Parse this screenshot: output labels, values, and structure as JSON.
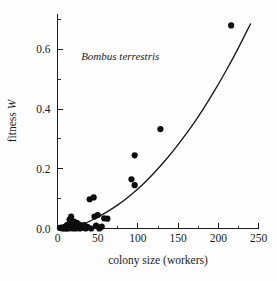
{
  "figure": {
    "annotation": "Bombus terrestris",
    "caption_fragment": ""
  },
  "chart_data": {
    "type": "scatter",
    "title": "",
    "subtitle": "",
    "annotations": [
      {
        "text": "Bombus terrestris",
        "x": 78,
        "y": 0.565,
        "style": "italic"
      }
    ],
    "xlabel": "colony size (workers)",
    "ylabel": "fitness W",
    "xlim": [
      0,
      250
    ],
    "ylim": [
      0,
      0.72
    ],
    "xticks": [
      0,
      50,
      100,
      150,
      200,
      250
    ],
    "xtick_labels": [
      "0",
      "50",
      "100",
      "150",
      "200",
      "250"
    ],
    "xticks_minor": [
      25,
      75,
      125,
      175,
      225
    ],
    "yticks": [
      0.0,
      0.2,
      0.4,
      0.6
    ],
    "ytick_labels": [
      "0.0",
      "0.2",
      "0.4",
      "0.6"
    ],
    "yticks_minor": [
      0.1,
      0.3,
      0.5,
      0.7
    ],
    "grid": false,
    "legend": null,
    "marker": "filled-circle",
    "marker_color": "#0d0d0d",
    "curve_color": "#181818",
    "series": [
      {
        "name": "colonies",
        "points": [
          [
            3,
            0.002
          ],
          [
            5,
            0.003
          ],
          [
            6,
            0.0
          ],
          [
            8,
            0.004
          ],
          [
            9,
            0.0
          ],
          [
            10,
            0.006
          ],
          [
            11,
            0.0
          ],
          [
            12,
            0.012
          ],
          [
            13,
            0.003
          ],
          [
            14,
            0.0
          ],
          [
            15,
            0.03
          ],
          [
            16,
            0.008
          ],
          [
            17,
            0.04
          ],
          [
            18,
            0.016
          ],
          [
            19,
            0.0
          ],
          [
            20,
            0.024
          ],
          [
            21,
            0.005
          ],
          [
            22,
            0.01
          ],
          [
            23,
            0.0
          ],
          [
            24,
            0.019
          ],
          [
            25,
            0.006
          ],
          [
            26,
            0.002
          ],
          [
            27,
            0.013
          ],
          [
            28,
            0.0
          ],
          [
            30,
            0.008
          ],
          [
            31,
            0.003
          ],
          [
            33,
            0.011
          ],
          [
            35,
            0.0
          ],
          [
            36,
            0.006
          ],
          [
            38,
            0.004
          ],
          [
            40,
            0.098
          ],
          [
            42,
            0.0
          ],
          [
            45,
            0.104
          ],
          [
            46,
            0.04
          ],
          [
            48,
            0.01
          ],
          [
            50,
            0.045
          ],
          [
            52,
            0.0
          ],
          [
            55,
            0.006
          ],
          [
            58,
            0.034
          ],
          [
            62,
            0.033
          ],
          [
            92,
            0.165
          ],
          [
            96,
            0.145
          ],
          [
            96,
            0.245
          ],
          [
            128,
            0.333
          ],
          [
            216,
            0.68
          ]
        ]
      }
    ],
    "fit_curve": {
      "name": "fitted curve",
      "points": [
        [
          18,
          0.0
        ],
        [
          30,
          0.012
        ],
        [
          45,
          0.031
        ],
        [
          60,
          0.053
        ],
        [
          75,
          0.079
        ],
        [
          90,
          0.11
        ],
        [
          105,
          0.145
        ],
        [
          120,
          0.186
        ],
        [
          135,
          0.231
        ],
        [
          150,
          0.281
        ],
        [
          165,
          0.335
        ],
        [
          180,
          0.395
        ],
        [
          195,
          0.46
        ],
        [
          210,
          0.53
        ],
        [
          225,
          0.605
        ],
        [
          240,
          0.685
        ]
      ]
    }
  }
}
